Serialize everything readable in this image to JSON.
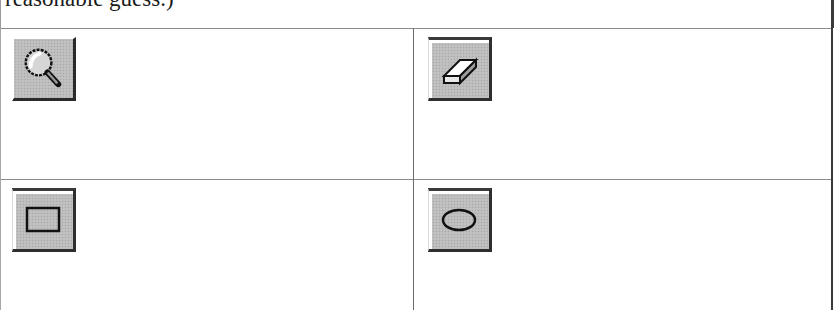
{
  "caption": {
    "text": "reasonable guess.)"
  },
  "tools": [
    {
      "name": "Magnifier",
      "icon": "magnifier-icon",
      "row": 0,
      "col": 0
    },
    {
      "name": "Eraser",
      "icon": "eraser-icon",
      "row": 0,
      "col": 1
    },
    {
      "name": "Rectangle",
      "icon": "rectangle-icon",
      "row": 1,
      "col": 0
    },
    {
      "name": "Ellipse",
      "icon": "ellipse-icon",
      "row": 1,
      "col": 1
    }
  ],
  "colors": {
    "button_face": "#bcbcbc",
    "button_shadow": "#2a2a2a",
    "button_highlight": "#ffffff",
    "grid_line": "#8a8a8a",
    "outer_border": "#3a3a3a",
    "text": "#1a1a1a"
  }
}
